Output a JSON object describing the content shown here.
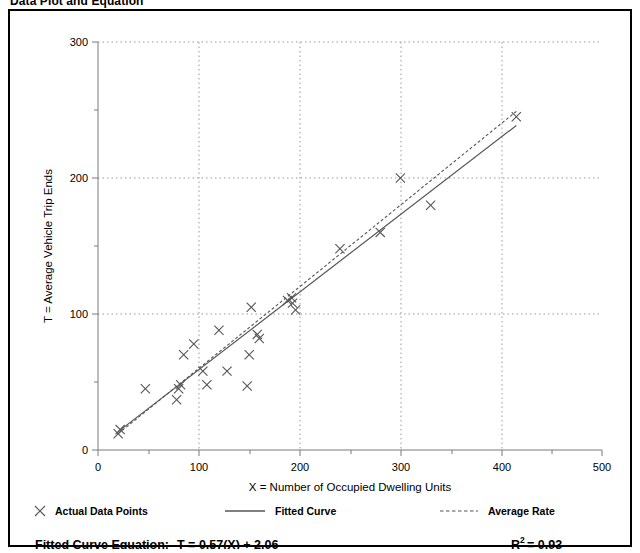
{
  "page": {
    "title": "Data Plot and Equation"
  },
  "chart_data": {
    "type": "scatter",
    "title": "Data Plot and Equation",
    "xlabel": "X = Number of Occupied Dwelling Units",
    "ylabel": "T = Average Vehicle Trip Ends",
    "xlim": [
      0,
      500
    ],
    "ylim": [
      0,
      300
    ],
    "xticks": [
      0,
      100,
      200,
      300,
      400,
      500
    ],
    "xtick_labels": [
      "0",
      "100",
      "200",
      "300",
      "400",
      "500"
    ],
    "xminor_ticks": [
      50,
      150,
      250,
      350,
      450
    ],
    "yticks": [
      0,
      100,
      200,
      300
    ],
    "ytick_labels": [
      "0",
      "100",
      "200",
      "300"
    ],
    "yminor_ticks": [
      50,
      150,
      250
    ],
    "grid": "dotted gridlines at major x and y ticks",
    "legend_position": "below plot, horizontal",
    "series": [
      {
        "name": "Actual Data Points",
        "type": "scatter",
        "marker": "x",
        "points": [
          [
            20,
            12
          ],
          [
            22,
            15
          ],
          [
            47,
            45
          ],
          [
            78,
            37
          ],
          [
            80,
            45
          ],
          [
            82,
            48
          ],
          [
            85,
            70
          ],
          [
            95,
            78
          ],
          [
            104,
            58
          ],
          [
            108,
            48
          ],
          [
            120,
            88
          ],
          [
            128,
            58
          ],
          [
            148,
            47
          ],
          [
            150,
            70
          ],
          [
            152,
            105
          ],
          [
            158,
            85
          ],
          [
            160,
            82
          ],
          [
            188,
            110
          ],
          [
            192,
            112
          ],
          [
            193,
            108
          ],
          [
            196,
            103
          ],
          [
            240,
            148
          ],
          [
            280,
            160
          ],
          [
            300,
            200
          ],
          [
            330,
            180
          ],
          [
            415,
            245
          ]
        ]
      },
      {
        "name": "Fitted Curve",
        "type": "line",
        "style": "solid",
        "equation": "T = 0.57(X) + 2.06",
        "endpoints": [
          [
            20,
            13.5
          ],
          [
            415,
            238.6
          ]
        ]
      },
      {
        "name": "Average Rate",
        "type": "line",
        "style": "dashed",
        "endpoints": [
          [
            20,
            12
          ],
          [
            415,
            249
          ]
        ]
      }
    ]
  },
  "legend": {
    "items": [
      {
        "label": "Actual Data Points",
        "marker": "x-marker"
      },
      {
        "label": "Fitted Curve",
        "marker": "solid-line"
      },
      {
        "label": "Average Rate",
        "marker": "dashed-line"
      }
    ]
  },
  "equation_row": {
    "fitted_label": "Fitted Curve Equation:",
    "fitted_value": "T = 0.57(X) + 2.06",
    "r_squared_base": "R",
    "r_squared_exp": "2",
    "r_squared_value": "= 0.93"
  }
}
